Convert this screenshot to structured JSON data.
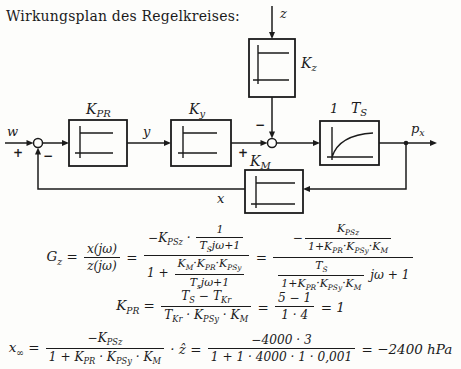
{
  "title": "Wirkungsplan des Regelkreises:",
  "diagram": {
    "signals": {
      "w": "w",
      "y": "y",
      "z": "z",
      "x": "x",
      "px_main": "p",
      "px_sub": "x"
    },
    "blocks": {
      "kpr_main": "K",
      "kpr_sub": "PR",
      "ky_main": "K",
      "ky_sub": "y",
      "kz_main": "K",
      "kz_sub": "z",
      "km_main": "K",
      "km_sub": "M",
      "ts_coeff": "1",
      "ts_main": "T",
      "ts_sub": "S"
    },
    "signs": {
      "w_plus": "+",
      "feedback_minus": "−",
      "ky_plus": "+",
      "kz_minus": "−"
    },
    "ink_color": "#1b1b1b",
    "paper_color": "#fdfdfb"
  },
  "formulas": [
    {
      "name": "disturbance-transfer-function",
      "nodes": [
        {
          "t": "G_{z} = "
        },
        {
          "f": {
            "n": [
              {
                "t": "x(jω)"
              }
            ],
            "d": [
              {
                "t": "z(jω)"
              }
            ]
          }
        },
        {
          "t": " = "
        },
        {
          "f": {
            "n": [
              {
                "t": "−K_{PSz} · "
              },
              {
                "f": {
                  "n": [
                    {
                      "t": "1"
                    }
                  ],
                  "d": [
                    {
                      "t": "T_{S}jω+1"
                    }
                  ]
                }
              }
            ],
            "d": [
              {
                "t": "1 + "
              },
              {
                "f": {
                  "n": [
                    {
                      "t": "K_{M}·K_{PR}·K_{PSy}"
                    }
                  ],
                  "d": [
                    {
                      "t": "T_{s}jω+1"
                    }
                  ]
                }
              }
            ]
          }
        },
        {
          "t": " = "
        },
        {
          "f": {
            "n": [
              {
                "t": "−"
              },
              {
                "f": {
                  "n": [
                    {
                      "t": "K_{PSz}"
                    }
                  ],
                  "d": [
                    {
                      "t": "1+K_{PR}·K_{PSy}·K_{M}"
                    }
                  ]
                }
              }
            ],
            "d": [
              {
                "f": {
                  "n": [
                    {
                      "t": "T_{S}"
                    }
                  ],
                  "d": [
                    {
                      "t": "1+K_{PR}·K_{PSy}·K_{M}"
                    }
                  ]
                }
              },
              {
                "t": " jω + 1"
              }
            ]
          }
        }
      ]
    },
    {
      "name": "controller-gain",
      "nodes": [
        {
          "t": "K_{PR} = "
        },
        {
          "f": {
            "n": [
              {
                "t": "T_{S} − T_{Kr}"
              }
            ],
            "d": [
              {
                "t": "T_{Kr} · K_{PSy} · K_{M}"
              }
            ]
          }
        },
        {
          "t": " = "
        },
        {
          "f": {
            "n": [
              {
                "t": "5 − 1"
              }
            ],
            "d": [
              {
                "t": "1 · 4"
              }
            ]
          }
        },
        {
          "t": " = 1"
        }
      ]
    },
    {
      "name": "steady-state-deviation",
      "nodes": [
        {
          "t": "x_{∞} = "
        },
        {
          "f": {
            "n": [
              {
                "t": "−K_{PSz}"
              }
            ],
            "d": [
              {
                "t": "1 + K_{PR} · K_{PSy} · K_{M}"
              }
            ]
          }
        },
        {
          "t": " · ẑ = "
        },
        {
          "f": {
            "n": [
              {
                "t": "−4000 · 3"
              }
            ],
            "d": [
              {
                "t": "1 + 1 · 4000 · 1 · 0,001"
              }
            ]
          }
        },
        {
          "t": " = −2400 hPa"
        }
      ]
    }
  ]
}
